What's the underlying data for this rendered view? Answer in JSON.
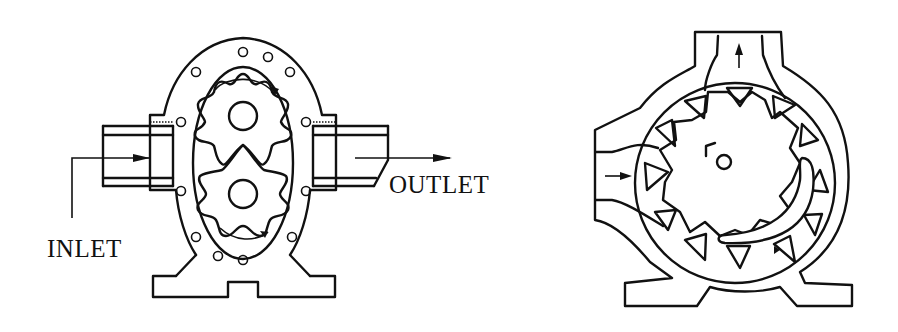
{
  "figure": {
    "panels": [
      {
        "id": "external-gear-pump",
        "labels": {
          "inlet": "INLET",
          "outlet": "OUTLET"
        }
      },
      {
        "id": "internal-gear-pump",
        "labels": {}
      }
    ],
    "colors": {
      "ink": "#111111",
      "background": "#ffffff"
    }
  }
}
